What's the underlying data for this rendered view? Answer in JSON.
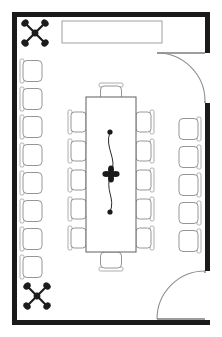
{
  "document": {
    "type": "architectural-floor-plan",
    "title": "Conference Room Floor Plan",
    "width": 222,
    "height": 337,
    "background_color": "#ffffff",
    "wall_color": "#1a1a1a",
    "furniture_outline_color": "#8a8a8a",
    "accent_color": "#1c1c1c"
  },
  "room": {
    "name": "conference-room",
    "shape": "rectangle",
    "wall_thickness_px": 5,
    "bounds": {
      "x": 12,
      "y": 12,
      "width": 198,
      "height": 313
    }
  },
  "credenza": {
    "name": "credenza",
    "label": "Credenza / Buffet Counter",
    "x": 62,
    "y": 21,
    "width": 100,
    "height": 22
  },
  "conference_table": {
    "name": "conference-table",
    "label": "Conference Table",
    "x": 86,
    "y": 97,
    "width": 50,
    "height": 155,
    "seats_total": 12
  },
  "centerpiece": {
    "name": "floral-centerpiece",
    "label": "Floral Centerpiece Runner",
    "bloom_center": {
      "x": 111,
      "y": 174
    },
    "bud_top": {
      "x": 110,
      "y": 132
    },
    "bud_bottom": {
      "x": 110,
      "y": 212
    }
  },
  "plants": [
    {
      "name": "plant-top-left",
      "label": "Potted Plant",
      "x": 35,
      "y": 33,
      "radius": 13
    },
    {
      "name": "plant-bottom-left",
      "label": "Potted Plant",
      "x": 37,
      "y": 296,
      "radius": 13
    }
  ],
  "doors": [
    {
      "name": "door-upper-right",
      "label": "Entry Door (Upper Right)",
      "wall": "right",
      "hinge": {
        "x": 205,
        "y": 53
      },
      "leaf_length": 50,
      "swing": "inward-down"
    },
    {
      "name": "door-lower-right",
      "label": "Entry Door (Lower Right)",
      "wall": "right",
      "hinge": {
        "x": 205,
        "y": 271
      },
      "leaf_length": 50,
      "swing": "inward-up"
    }
  ],
  "seating": {
    "table_left": {
      "name": "table-chairs-left",
      "label": "Table Chairs (West Side)",
      "count": 5,
      "orientation": "facing-east",
      "x": 70,
      "y_start": 110,
      "spacing": 29,
      "chair_width": 18,
      "chair_height": 24
    },
    "table_right": {
      "name": "table-chairs-right",
      "label": "Table Chairs (East Side)",
      "count": 5,
      "orientation": "facing-west",
      "x": 134,
      "y_start": 110,
      "spacing": 29,
      "chair_width": 18,
      "chair_height": 24
    },
    "table_head_top": {
      "name": "table-chair-head-north",
      "label": "Head Chair (North)",
      "count": 1,
      "orientation": "facing-south",
      "x": 99,
      "y": 83
    },
    "table_head_bottom": {
      "name": "table-chair-head-south",
      "label": "Head Chair (South)",
      "count": 1,
      "orientation": "facing-north",
      "x": 99,
      "y": 252
    },
    "wall_left": {
      "name": "wall-chairs-left",
      "label": "Perimeter Chairs (West Wall)",
      "count": 8,
      "orientation": "facing-east",
      "x": 20,
      "y_start": 59,
      "spacing": 28,
      "chair_width": 22,
      "chair_height": 24
    },
    "wall_right": {
      "name": "wall-chairs-right",
      "label": "Perimeter Chairs (East Wall)",
      "count": 5,
      "orientation": "facing-west",
      "x": 179,
      "y_start": 117,
      "spacing": 28,
      "chair_width": 22,
      "chair_height": 24
    }
  },
  "legend": {
    "total_seats": 24,
    "table_seats": 12,
    "perimeter_seats": 13
  }
}
